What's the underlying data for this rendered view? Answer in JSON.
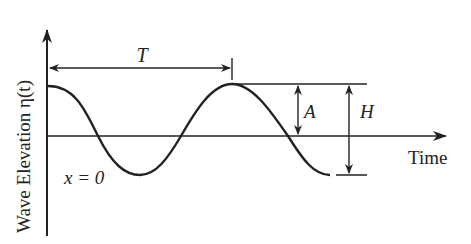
{
  "diagram": {
    "y_axis_label": "Wave Elevation η(t)",
    "x_axis_label": "Time",
    "period_label": "T",
    "amplitude_label": "A",
    "height_label": "H",
    "position_label": "x = 0"
  },
  "colors": {
    "stroke": "#222222",
    "background": "#ffffff"
  }
}
